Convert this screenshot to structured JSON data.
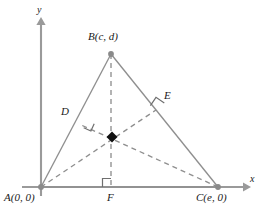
{
  "figure": {
    "width": 261,
    "height": 212,
    "background": "#ffffff"
  },
  "colors": {
    "axis": "#9a9a9a",
    "triangle_side": "#8f8f8f",
    "altitude_dashed": "#8f8f8f",
    "right_angle_mark": "#6f6f6f",
    "vertex_dot": "#8a8a8a",
    "orthocenter_marker": "#111111",
    "label_text": "#1a1a1a"
  },
  "axes": {
    "x_label": "x",
    "y_label": "y",
    "x_axis": {
      "x1": 22,
      "y1": 187,
      "x2": 248,
      "y2": 187
    },
    "y_axis": {
      "x1": 41,
      "y1": 196,
      "x2": 41,
      "y2": 18
    },
    "x_label_pos": {
      "x": 250,
      "y": 182
    },
    "y_label_pos": {
      "x": 37,
      "y": 6
    }
  },
  "vertices": [
    {
      "id": "A",
      "label": "A(0, 0)",
      "x": 41,
      "y": 187,
      "label_x": 4,
      "label_y": 192
    },
    {
      "id": "B",
      "label": "B(c, d)",
      "x": 111,
      "y": 54,
      "label_x": 88,
      "label_y": 33
    },
    {
      "id": "C",
      "label": "C(e, 0)",
      "x": 218,
      "y": 187,
      "label_x": 196,
      "label_y": 192
    }
  ],
  "feet": [
    {
      "id": "D",
      "label": "D",
      "x": 79,
      "y": 124,
      "label_x": 61,
      "label_y": 108
    },
    {
      "id": "E",
      "label": "E",
      "x": 156,
      "y": 110,
      "label_x": 164,
      "label_y": 92
    },
    {
      "id": "F",
      "label": "F",
      "x": 111,
      "y": 187,
      "label_x": 107,
      "label_y": 192
    }
  ],
  "orthocenter": {
    "id": "H",
    "x": 112,
    "y": 137,
    "marker": "filled-diamond",
    "size": 5
  },
  "sides": [
    {
      "name": "AB",
      "from": "A",
      "to": "B",
      "style": "solid"
    },
    {
      "name": "BC",
      "from": "B",
      "to": "C",
      "style": "solid"
    },
    {
      "name": "AC",
      "from": "A",
      "to": "C",
      "style": "solid"
    }
  ],
  "altitudes": [
    {
      "name": "altitude-from-B-to-F",
      "from": "B",
      "to": "F",
      "style": "dashed"
    },
    {
      "name": "altitude-from-A-to-E",
      "from": "A",
      "to": "E",
      "style": "dashed"
    },
    {
      "name": "altitude-from-C-to-D",
      "from": "C",
      "to": "D",
      "style": "dashed"
    }
  ],
  "right_angles": [
    {
      "at": "D",
      "size": 8
    },
    {
      "at": "E",
      "size": 8
    },
    {
      "at": "F",
      "size": 8
    }
  ]
}
